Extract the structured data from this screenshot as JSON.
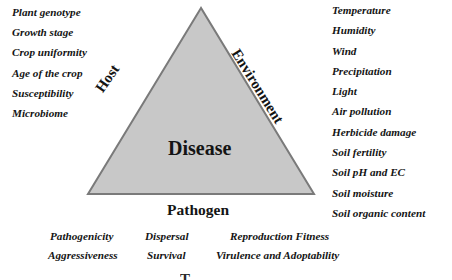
{
  "triangle": {
    "fill": "#c8c8c8",
    "stroke": "#7a7a7a",
    "center_label": "Disease"
  },
  "host": {
    "label": "Host",
    "factors": [
      "Plant genotype",
      "Growth stage",
      "Crop uniformity",
      "Age of the crop",
      "Susceptibility",
      "Microbiome"
    ]
  },
  "environment": {
    "label": "Environment",
    "factors": [
      "Temperature",
      "Humidity",
      "Wind",
      "Precipitation",
      "Light",
      "Air pollution",
      "Herbicide damage",
      "Soil fertility",
      "Soil pH and EC",
      "Soil moisture",
      "Soil organic content"
    ]
  },
  "pathogen": {
    "label": "Pathogen",
    "factors_row1": [
      "Pathogenicity",
      "Dispersal",
      "Reproduction Fitness"
    ],
    "factors_row2": [
      "Aggressiveness",
      "Survival",
      "Virulence and Adoptability"
    ]
  }
}
